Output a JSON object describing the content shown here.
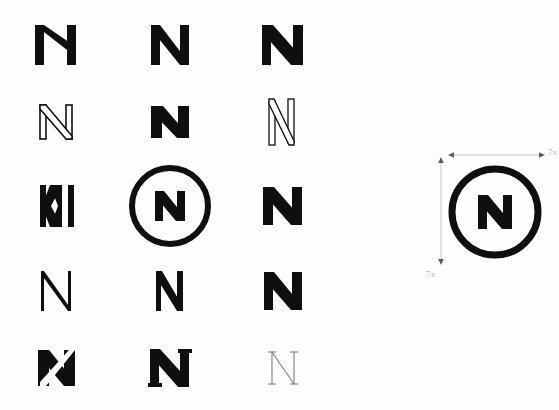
{
  "sheet": {
    "title": "N monogram logo exploration sheet",
    "background_color": "#ffffff",
    "ink_color": "#0f0f0f",
    "guide_color": "#b9b9b9"
  },
  "grid": {
    "columns": 3,
    "rows": 5,
    "selected_index": 7,
    "items": [
      {
        "id": "n-variant-1",
        "label": "N",
        "style": "bold-angled-diagonal",
        "weight": "bold",
        "fill": "solid",
        "selected": false
      },
      {
        "id": "n-variant-2",
        "label": "N",
        "style": "bold-geometric",
        "weight": "bold",
        "fill": "solid",
        "selected": false
      },
      {
        "id": "n-variant-3",
        "label": "N",
        "style": "bold-heavy-diagonal",
        "weight": "bold",
        "fill": "solid",
        "selected": false
      },
      {
        "id": "n-variant-4",
        "label": "N",
        "style": "outline-light",
        "weight": "light",
        "fill": "outline",
        "selected": false
      },
      {
        "id": "n-variant-5",
        "label": "N",
        "style": "extra-bold-compact",
        "weight": "black",
        "fill": "solid",
        "selected": false
      },
      {
        "id": "n-variant-6",
        "label": "N",
        "style": "outline-condensed-tall",
        "weight": "thin",
        "fill": "outline",
        "selected": false
      },
      {
        "id": "n-variant-7",
        "label": "N",
        "style": "split-stem-wedge",
        "weight": "bold",
        "fill": "solid",
        "selected": false
      },
      {
        "id": "n-variant-8",
        "label": "N",
        "style": "circle-enclosed-bold",
        "weight": "bold",
        "fill": "solid",
        "selected": true
      },
      {
        "id": "n-variant-9",
        "label": "N",
        "style": "bold-wide-diagonal",
        "weight": "bold",
        "fill": "solid",
        "selected": false
      },
      {
        "id": "n-variant-10",
        "label": "N",
        "style": "thin-geometric",
        "weight": "thin",
        "fill": "solid",
        "selected": false
      },
      {
        "id": "n-variant-11",
        "label": "N",
        "style": "medium-condensed",
        "weight": "medium",
        "fill": "solid",
        "selected": false
      },
      {
        "id": "n-variant-12",
        "label": "N",
        "style": "bold-sharp-diagonal",
        "weight": "bold",
        "fill": "solid",
        "selected": false
      },
      {
        "id": "n-variant-13",
        "label": "N",
        "style": "bold-slashed-counter",
        "weight": "bold",
        "fill": "solid",
        "selected": false
      },
      {
        "id": "n-variant-14",
        "label": "N",
        "style": "bold-flared-serif",
        "weight": "bold",
        "fill": "solid",
        "selected": false
      },
      {
        "id": "n-variant-15",
        "label": "N",
        "style": "thin-serif",
        "weight": "thin",
        "fill": "outline",
        "selected": false
      }
    ]
  },
  "spec": {
    "name": "construction-spec",
    "mark_label": "N",
    "mark_style": "circle-enclosed-bold",
    "width_label": "7x",
    "height_label": "7x"
  }
}
